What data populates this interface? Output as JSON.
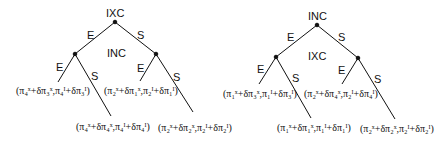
{
  "trees": [
    {
      "root_label": "IXC",
      "inner_label": "INC",
      "edges": {
        "root_left": "E",
        "root_right": "S",
        "left_left": "E",
        "left_right": "S",
        "right_left": "E",
        "right_right": "S"
      },
      "payoffs": {
        "EE": "(π₄ˣ+δπ₃ˣ,π₄ᴵ+δπ₃ᴵ)",
        "ES": "(π₄ˣ+δπ₄ˣ,π₄ᴵ+δπ₄ᴵ)",
        "SE": "(π₂ˣ+δπ₁ˣ,π₂ᴵ+δπ₁ᴵ)",
        "SS": "(π₂ˣ+δπ₂ˣ,π₂ᴵ+δπ₂ᴵ)"
      }
    },
    {
      "root_label": "INC",
      "inner_label": "IXC",
      "edges": {
        "root_left": "E",
        "root_right": "S",
        "left_left": "E",
        "left_right": "S",
        "right_left": "E",
        "right_right": "S"
      },
      "payoffs": {
        "EE": "(π₁ˣ+δπ₃ˣ,π₁ᴵ+δπ₃ᴵ)",
        "ES": "(π₁ˣ+δπ₁ˣ,π₁ᴵ+δπ₁ᴵ)",
        "SE": "(π₂ˣ+δπ₄ˣ,π₂ᴵ+δπ₄ᴵ)",
        "SS": "(π₂ˣ+δπ₂ˣ,π₂ᴵ+δπ₂ᴵ)"
      }
    }
  ]
}
